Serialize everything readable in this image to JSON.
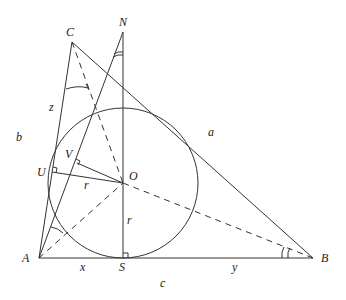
{
  "diagram": {
    "points": {
      "A": {
        "label": "A",
        "x": 39,
        "y": 258
      },
      "B": {
        "label": "B",
        "x": 313,
        "y": 258
      },
      "C": {
        "label": "C",
        "x": 72,
        "y": 42
      },
      "N": {
        "label": "N",
        "x": 123,
        "y": 32
      },
      "O": {
        "label": "O",
        "x": 123,
        "y": 183
      },
      "S": {
        "label": "S",
        "x": 123,
        "y": 258
      },
      "U": {
        "label": "U",
        "x": 52,
        "y": 172
      },
      "V": {
        "label": "V",
        "x": 77,
        "y": 163
      }
    },
    "segment_labels": {
      "a": "a",
      "b": "b",
      "c": "c",
      "x": "x",
      "y": "y",
      "z": "z",
      "r_OU": "r",
      "r_OS": "r"
    },
    "incircle": {
      "center": "O",
      "radius": 75
    }
  }
}
